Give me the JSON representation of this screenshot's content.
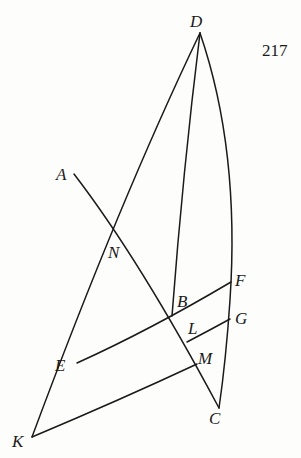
{
  "page_number": "217",
  "labels": {
    "D": "D",
    "A": "A",
    "N": "N",
    "B": "B",
    "F": "F",
    "L": "L",
    "G": "G",
    "E": "E",
    "M": "M",
    "C": "C",
    "K": "K"
  },
  "colors": {
    "ink": "#1a1a1a",
    "paper": "#fdfdfc"
  }
}
